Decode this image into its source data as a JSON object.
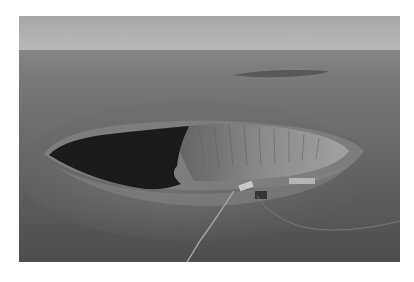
{
  "image": {
    "subject": "aerial view of a meteor impact crater in a flat desert plain",
    "style": "grayscale photograph",
    "colors": {
      "background": "#ffffff",
      "sky": "#b9b9b9",
      "horizon_haze": "#8e8e8e",
      "plain_far": "#747474",
      "plain_near": "#4e4e4e",
      "crater_shadow": "#0c0c0c",
      "crater_wall_lit": "#9a9a9a",
      "rim": "#8a8a8a",
      "buildings": "#d0d0d0"
    }
  }
}
